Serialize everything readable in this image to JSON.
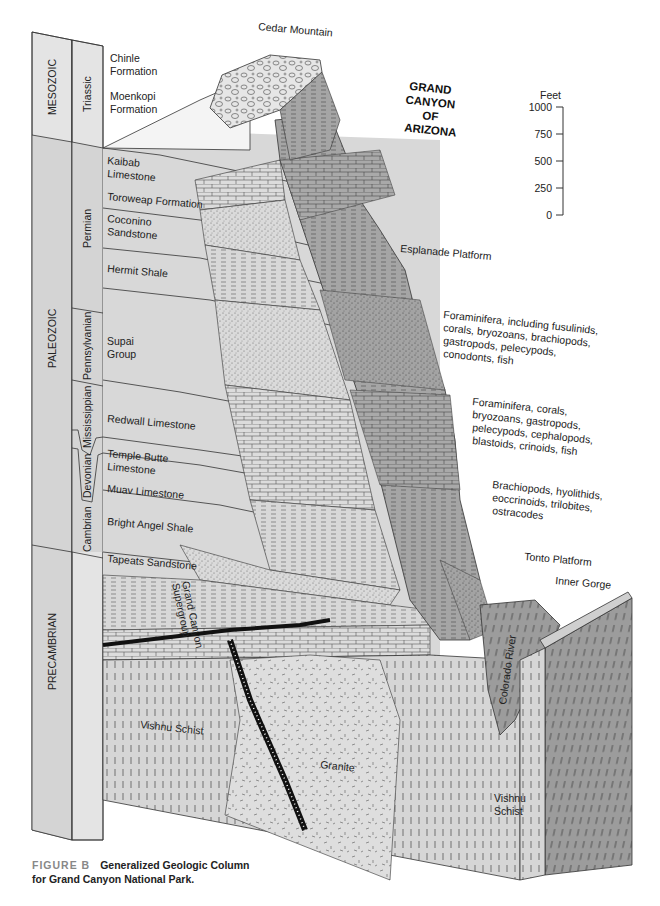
{
  "title": {
    "lines": [
      "GRAND",
      "CANYON",
      "OF",
      "ARIZONA"
    ]
  },
  "scale_bar": {
    "unit": "Feet",
    "ticks": [
      "1000",
      "750",
      "500",
      "250",
      "0"
    ]
  },
  "eras": [
    {
      "label": "MESOZOIC"
    },
    {
      "label": "PALEOZOIC"
    },
    {
      "label": "PRECAMBRIAN"
    }
  ],
  "periods": [
    {
      "label": "Triassic"
    },
    {
      "label": "Permian"
    },
    {
      "label": "Pennsylvanian"
    },
    {
      "label": "Mississippian"
    },
    {
      "label": "Devonian"
    },
    {
      "label": "Cambrian"
    }
  ],
  "formations": [
    {
      "line1": "Chinle",
      "line2": "Formation"
    },
    {
      "line1": "Moenkopi",
      "line2": "Formation"
    },
    {
      "line1": "Kaibab",
      "line2": "Limestone"
    },
    {
      "line1": "Toroweap Formation",
      "line2": ""
    },
    {
      "line1": "Coconino",
      "line2": "Sandstone"
    },
    {
      "line1": "Hermit Shale",
      "line2": ""
    },
    {
      "line1": "Supai",
      "line2": "Group"
    },
    {
      "line1": "Redwall Limestone",
      "line2": ""
    },
    {
      "line1": "Temple Butte",
      "line2": "Limestone"
    },
    {
      "line1": "Muav Limestone",
      "line2": ""
    },
    {
      "line1": "Bright Angel Shale",
      "line2": ""
    },
    {
      "line1": "Tapeats Sandstone",
      "line2": ""
    }
  ],
  "features": {
    "cedar_mountain": "Cedar Mountain",
    "esplanade": "Esplanade Platform",
    "tonto": "Tonto Platform",
    "inner_gorge": "Inner Gorge",
    "colorado_river": "Colorado River",
    "supergroup_1": "Grand Canyon",
    "supergroup_2": "Supergroup",
    "vishnu_left": "Vishnu Schist",
    "granite": "Granite",
    "vishnu_right_1": "Vishnu",
    "vishnu_right_2": "Schist"
  },
  "fossils": [
    {
      "lines": [
        "Foraminifera, including fusulinids,",
        "corals, bryozoans, brachiopods,",
        "gastropods, pelecypods,",
        "conodonts, fish"
      ]
    },
    {
      "lines": [
        "Foraminifera, corals,",
        "bryozoans, gastropods,",
        "pelecypods, cephalopods,",
        "blastoids, crinoids, fish"
      ]
    },
    {
      "lines": [
        "Brachiopods, hyolithids,",
        "eoccrinoids, trilobites,",
        "ostracodes"
      ]
    }
  ],
  "caption": {
    "figure": "FIGURE B",
    "line1": "Generalized Geologic Column",
    "line2": "for Grand Canyon National Park."
  },
  "colors": {
    "column_fill": "#e2e2e2",
    "front_face": "#d6d6d6",
    "cliff_face": "#a8a8a8",
    "dark_face": "#8f8f8f",
    "ink": "#222222"
  }
}
